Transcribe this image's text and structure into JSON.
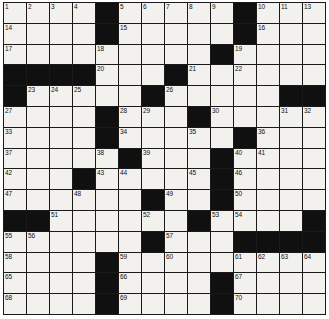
{
  "puzzle": {
    "kind": "crossword-grid",
    "columns": 14,
    "rows": 15,
    "colors": {
      "block": "#101010",
      "open": "#f2f1ee",
      "gridline": "#1a1a1a",
      "number_text": "#101010",
      "page_background": "#ffffff"
    },
    "legend": {
      "black_cell": "block",
      "white_cell": "open"
    },
    "cells": [
      [
        {
          "t": "open",
          "n": "1"
        },
        {
          "t": "open",
          "n": "2"
        },
        {
          "t": "open",
          "n": "3"
        },
        {
          "t": "open",
          "n": "4"
        },
        {
          "t": "block",
          "n": ""
        },
        {
          "t": "open",
          "n": "5"
        },
        {
          "t": "open",
          "n": "6"
        },
        {
          "t": "open",
          "n": "7"
        },
        {
          "t": "open",
          "n": "8"
        },
        {
          "t": "open",
          "n": "9"
        },
        {
          "t": "block",
          "n": ""
        },
        {
          "t": "open",
          "n": "10"
        },
        {
          "t": "open",
          "n": "11"
        },
        {
          "t": "open",
          "n": "12"
        }
      ],
      [
        {
          "t": "open",
          "n": "14"
        },
        {
          "t": "open",
          "n": ""
        },
        {
          "t": "open",
          "n": ""
        },
        {
          "t": "open",
          "n": ""
        },
        {
          "t": "block",
          "n": ""
        },
        {
          "t": "open",
          "n": "15"
        },
        {
          "t": "open",
          "n": ""
        },
        {
          "t": "open",
          "n": ""
        },
        {
          "t": "open",
          "n": ""
        },
        {
          "t": "open",
          "n": ""
        },
        {
          "t": "block",
          "n": ""
        },
        {
          "t": "open",
          "n": "16"
        },
        {
          "t": "open",
          "n": ""
        },
        {
          "t": "open",
          "n": ""
        }
      ],
      [
        {
          "t": "open",
          "n": "17"
        },
        {
          "t": "open",
          "n": ""
        },
        {
          "t": "open",
          "n": ""
        },
        {
          "t": "open",
          "n": ""
        },
        {
          "t": "open",
          "n": "18"
        },
        {
          "t": "open",
          "n": ""
        },
        {
          "t": "open",
          "n": ""
        },
        {
          "t": "open",
          "n": ""
        },
        {
          "t": "open",
          "n": ""
        },
        {
          "t": "block",
          "n": ""
        },
        {
          "t": "open",
          "n": "19"
        },
        {
          "t": "open",
          "n": ""
        },
        {
          "t": "open",
          "n": ""
        },
        {
          "t": "open",
          "n": ""
        }
      ],
      [
        {
          "t": "block",
          "n": ""
        },
        {
          "t": "block",
          "n": ""
        },
        {
          "t": "block",
          "n": ""
        },
        {
          "t": "block",
          "n": ""
        },
        {
          "t": "open",
          "n": "20"
        },
        {
          "t": "open",
          "n": ""
        },
        {
          "t": "open",
          "n": ""
        },
        {
          "t": "block",
          "n": ""
        },
        {
          "t": "open",
          "n": "21"
        },
        {
          "t": "open",
          "n": ""
        },
        {
          "t": "open",
          "n": "22"
        },
        {
          "t": "open",
          "n": ""
        },
        {
          "t": "open",
          "n": ""
        },
        {
          "t": "open",
          "n": ""
        }
      ],
      [
        {
          "t": "block",
          "n": ""
        },
        {
          "t": "open",
          "n": "23"
        },
        {
          "t": "open",
          "n": "24"
        },
        {
          "t": "open",
          "n": "25"
        },
        {
          "t": "open",
          "n": ""
        },
        {
          "t": "open",
          "n": ""
        },
        {
          "t": "block",
          "n": ""
        },
        {
          "t": "open",
          "n": "26"
        },
        {
          "t": "open",
          "n": ""
        },
        {
          "t": "open",
          "n": ""
        },
        {
          "t": "open",
          "n": ""
        },
        {
          "t": "open",
          "n": ""
        },
        {
          "t": "block",
          "n": ""
        },
        {
          "t": "block",
          "n": ""
        }
      ],
      [
        {
          "t": "open",
          "n": "27"
        },
        {
          "t": "open",
          "n": ""
        },
        {
          "t": "open",
          "n": ""
        },
        {
          "t": "open",
          "n": ""
        },
        {
          "t": "block",
          "n": ""
        },
        {
          "t": "open",
          "n": "28"
        },
        {
          "t": "open",
          "n": "29"
        },
        {
          "t": "open",
          "n": ""
        },
        {
          "t": "block",
          "n": ""
        },
        {
          "t": "open",
          "n": "30"
        },
        {
          "t": "open",
          "n": ""
        },
        {
          "t": "open",
          "n": ""
        },
        {
          "t": "open",
          "n": "31"
        },
        {
          "t": "open",
          "n": "32"
        }
      ],
      [
        {
          "t": "open",
          "n": "33"
        },
        {
          "t": "open",
          "n": ""
        },
        {
          "t": "open",
          "n": ""
        },
        {
          "t": "open",
          "n": ""
        },
        {
          "t": "block",
          "n": ""
        },
        {
          "t": "open",
          "n": "34"
        },
        {
          "t": "open",
          "n": ""
        },
        {
          "t": "open",
          "n": ""
        },
        {
          "t": "open",
          "n": "35"
        },
        {
          "t": "open",
          "n": ""
        },
        {
          "t": "block",
          "n": ""
        },
        {
          "t": "open",
          "n": "36"
        },
        {
          "t": "open",
          "n": ""
        },
        {
          "t": "open",
          "n": ""
        }
      ],
      [
        {
          "t": "open",
          "n": "37"
        },
        {
          "t": "open",
          "n": ""
        },
        {
          "t": "open",
          "n": ""
        },
        {
          "t": "open",
          "n": ""
        },
        {
          "t": "open",
          "n": "38"
        },
        {
          "t": "block",
          "n": ""
        },
        {
          "t": "open",
          "n": "39"
        },
        {
          "t": "open",
          "n": ""
        },
        {
          "t": "open",
          "n": ""
        },
        {
          "t": "block",
          "n": ""
        },
        {
          "t": "open",
          "n": "40"
        },
        {
          "t": "open",
          "n": "41"
        },
        {
          "t": "open",
          "n": ""
        },
        {
          "t": "open",
          "n": ""
        }
      ],
      [
        {
          "t": "open",
          "n": "42"
        },
        {
          "t": "open",
          "n": ""
        },
        {
          "t": "open",
          "n": ""
        },
        {
          "t": "block",
          "n": ""
        },
        {
          "t": "open",
          "n": "43"
        },
        {
          "t": "open",
          "n": "44"
        },
        {
          "t": "open",
          "n": ""
        },
        {
          "t": "open",
          "n": ""
        },
        {
          "t": "open",
          "n": "45"
        },
        {
          "t": "block",
          "n": ""
        },
        {
          "t": "open",
          "n": "46"
        },
        {
          "t": "open",
          "n": ""
        },
        {
          "t": "open",
          "n": ""
        },
        {
          "t": "open",
          "n": ""
        }
      ],
      [
        {
          "t": "open",
          "n": "47"
        },
        {
          "t": "open",
          "n": ""
        },
        {
          "t": "open",
          "n": ""
        },
        {
          "t": "open",
          "n": "48"
        },
        {
          "t": "open",
          "n": ""
        },
        {
          "t": "open",
          "n": ""
        },
        {
          "t": "block",
          "n": ""
        },
        {
          "t": "open",
          "n": "49"
        },
        {
          "t": "open",
          "n": ""
        },
        {
          "t": "block",
          "n": ""
        },
        {
          "t": "open",
          "n": "50"
        },
        {
          "t": "open",
          "n": ""
        },
        {
          "t": "open",
          "n": ""
        },
        {
          "t": "open",
          "n": ""
        }
      ],
      [
        {
          "t": "block",
          "n": ""
        },
        {
          "t": "block",
          "n": ""
        },
        {
          "t": "open",
          "n": "51"
        },
        {
          "t": "open",
          "n": ""
        },
        {
          "t": "open",
          "n": ""
        },
        {
          "t": "open",
          "n": ""
        },
        {
          "t": "open",
          "n": "52"
        },
        {
          "t": "open",
          "n": ""
        },
        {
          "t": "block",
          "n": ""
        },
        {
          "t": "open",
          "n": "53"
        },
        {
          "t": "open",
          "n": "54"
        },
        {
          "t": "open",
          "n": ""
        },
        {
          "t": "open",
          "n": ""
        },
        {
          "t": "block",
          "n": ""
        }
      ],
      [
        {
          "t": "open",
          "n": "55"
        },
        {
          "t": "open",
          "n": "56"
        },
        {
          "t": "open",
          "n": ""
        },
        {
          "t": "open",
          "n": ""
        },
        {
          "t": "open",
          "n": ""
        },
        {
          "t": "open",
          "n": ""
        },
        {
          "t": "block",
          "n": ""
        },
        {
          "t": "open",
          "n": "57"
        },
        {
          "t": "open",
          "n": ""
        },
        {
          "t": "open",
          "n": ""
        },
        {
          "t": "block",
          "n": ""
        },
        {
          "t": "block",
          "n": ""
        },
        {
          "t": "block",
          "n": ""
        },
        {
          "t": "block",
          "n": ""
        }
      ],
      [
        {
          "t": "open",
          "n": "58"
        },
        {
          "t": "open",
          "n": ""
        },
        {
          "t": "open",
          "n": ""
        },
        {
          "t": "open",
          "n": ""
        },
        {
          "t": "block",
          "n": ""
        },
        {
          "t": "open",
          "n": "59"
        },
        {
          "t": "open",
          "n": ""
        },
        {
          "t": "open",
          "n": "60"
        },
        {
          "t": "open",
          "n": ""
        },
        {
          "t": "open",
          "n": ""
        },
        {
          "t": "open",
          "n": "61"
        },
        {
          "t": "open",
          "n": "62"
        },
        {
          "t": "open",
          "n": "63"
        },
        {
          "t": "open",
          "n": "64"
        }
      ],
      [
        {
          "t": "open",
          "n": "65"
        },
        {
          "t": "open",
          "n": ""
        },
        {
          "t": "open",
          "n": ""
        },
        {
          "t": "open",
          "n": ""
        },
        {
          "t": "block",
          "n": ""
        },
        {
          "t": "open",
          "n": "66"
        },
        {
          "t": "open",
          "n": ""
        },
        {
          "t": "open",
          "n": ""
        },
        {
          "t": "open",
          "n": ""
        },
        {
          "t": "block",
          "n": ""
        },
        {
          "t": "open",
          "n": "67"
        },
        {
          "t": "open",
          "n": ""
        },
        {
          "t": "open",
          "n": ""
        },
        {
          "t": "open",
          "n": ""
        }
      ],
      [
        {
          "t": "open",
          "n": "68"
        },
        {
          "t": "open",
          "n": ""
        },
        {
          "t": "open",
          "n": ""
        },
        {
          "t": "open",
          "n": ""
        },
        {
          "t": "block",
          "n": ""
        },
        {
          "t": "open",
          "n": "69"
        },
        {
          "t": "open",
          "n": ""
        },
        {
          "t": "open",
          "n": ""
        },
        {
          "t": "open",
          "n": ""
        },
        {
          "t": "block",
          "n": ""
        },
        {
          "t": "open",
          "n": "70"
        },
        {
          "t": "open",
          "n": ""
        },
        {
          "t": "open",
          "n": ""
        },
        {
          "t": "open",
          "n": ""
        }
      ]
    ],
    "row13_extra": [
      {
        "t": "open",
        "n": "13"
      }
    ]
  }
}
